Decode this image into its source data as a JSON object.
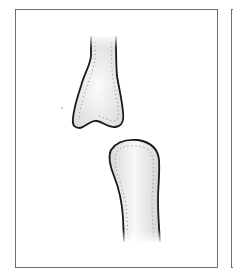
{
  "figure": {
    "panels": [
      {
        "id": "panel-1",
        "content": [
          "upper-bone-distal-end",
          "lower-bone-proximal-end"
        ]
      },
      {
        "id": "panel-2",
        "content": []
      }
    ],
    "colors": {
      "frame": "#6e6e6e",
      "outline": "#1a1a1a",
      "bone_fill": "#e6e6e6",
      "bone_highlight": "#fbfbfb",
      "stipple": "#8a8a8a"
    }
  }
}
